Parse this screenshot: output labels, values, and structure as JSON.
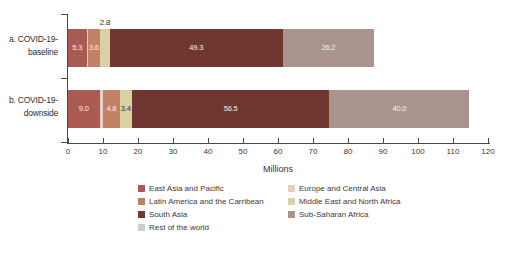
{
  "chart_data": {
    "type": "bar",
    "stacked": true,
    "orientation": "horizontal",
    "title": "",
    "xlabel": "Millions",
    "xlim": [
      0,
      120
    ],
    "x_tick_step": 10,
    "grid": false,
    "categories": [
      "a. COVID-19-baseline",
      "b. COVID-19-downside"
    ],
    "category_label_lines": [
      [
        "a. COVID-19-",
        "baseline"
      ],
      [
        "b. COVID-19-",
        "downside"
      ]
    ],
    "series": [
      {
        "name": "East Asia and Pacific",
        "color": "#ab5a52",
        "values": [
          5.3,
          9.0
        ],
        "value_labels": [
          "5.3",
          "9.0"
        ],
        "label_color": "#f7f2f0",
        "label_placement": [
          "inside",
          "inside"
        ]
      },
      {
        "name": "Europe and Central Asia",
        "color": "#e7cfc8",
        "values": [
          0.3,
          1.0
        ],
        "value_labels": [
          "",
          ""
        ],
        "label_color": "#3a3a3a",
        "label_placement": [
          "none",
          "none"
        ],
        "note": "sliver segment, value estimated from pixel width, no label shown"
      },
      {
        "name": "Latin America and the Carribean",
        "color": "#c08165",
        "values": [
          3.6,
          4.8
        ],
        "value_labels": [
          "3.6",
          "4.8"
        ],
        "label_color": "#f7f2f0",
        "label_placement": [
          "inside",
          "inside"
        ]
      },
      {
        "name": "Middle East and North Africa",
        "color": "#d9d0a4",
        "values": [
          2.8,
          3.4
        ],
        "value_labels": [
          "2.8",
          "3.4"
        ],
        "label_color": "#2f2f2f",
        "label_placement": [
          "above",
          "inside"
        ]
      },
      {
        "name": "South Asia",
        "color": "#6f372f",
        "values": [
          49.3,
          56.5
        ],
        "value_labels": [
          "49.3",
          "56.5"
        ],
        "label_color": "#f7f2f0",
        "label_placement": [
          "inside",
          "inside"
        ]
      },
      {
        "name": "Sub-Saharan Africa",
        "color": "#aa938c",
        "values": [
          26.2,
          40.0
        ],
        "value_labels": [
          "26.2",
          "40.0"
        ],
        "label_color": "#f7f2f0",
        "label_placement": [
          "inside",
          "inside"
        ]
      },
      {
        "name": "Rest of the world",
        "color": "#d3cdca",
        "values": [
          0,
          0
        ],
        "value_labels": [
          "",
          ""
        ],
        "label_color": "#3a3a3a",
        "label_placement": [
          "none",
          "none"
        ],
        "note": "legend entry only, segment not visible in bars"
      }
    ],
    "legend": {
      "position": "bottom",
      "columns": [
        [
          "East Asia and Pacific",
          "Latin America and the Carribean",
          "South Asia",
          "Rest of the world"
        ],
        [
          "Europe and Central Asia",
          "Middle East and North Africa",
          "Sub-Saharan Africa"
        ]
      ]
    }
  }
}
